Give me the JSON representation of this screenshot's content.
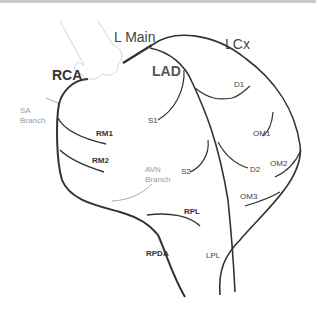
{
  "diagram": {
    "main_labels": {
      "l_main": "L Main",
      "rca": "RCA",
      "lad": "LAD",
      "lcx": "LCx"
    },
    "branch_labels": {
      "sa_branch_line1": "SA",
      "sa_branch_line2": "Branch",
      "avn_branch_line1": "AVN",
      "avn_branch_line2": "Branch",
      "rm1": "RM1",
      "rm2": "RM2",
      "rpl": "RPL",
      "rpda": "RPDA",
      "s1": "S1",
      "s2": "S2",
      "d1": "D1",
      "d2": "D2",
      "om1": "OM1",
      "om2": "OM2",
      "om3": "OM3",
      "lpl": "LPL"
    },
    "colors": {
      "vessel": "#333333",
      "aorta_outline": "#d0d0d0",
      "minor_label": "#999999"
    }
  }
}
